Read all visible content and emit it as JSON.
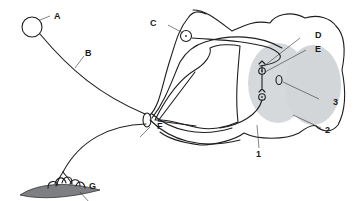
{
  "diagram": {
    "colors": {
      "line": "#1e1e1e",
      "grey_matter": "#d6d9db",
      "skin": "#7d7f82",
      "background": "#ffffff"
    },
    "labels": {
      "A": "A",
      "B": "B",
      "C": "C",
      "D": "D",
      "E": "E",
      "F": "F",
      "G": "G",
      "n1": "1",
      "n2": "2",
      "n3": "3"
    }
  }
}
